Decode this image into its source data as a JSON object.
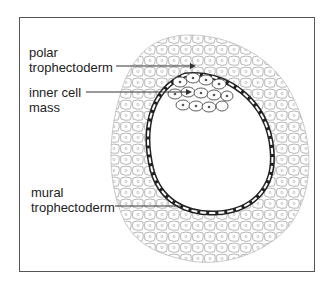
{
  "diagram": {
    "labels": {
      "polar_line1": "polar",
      "polar_line2": "trophectoderm",
      "icm_line1": "inner cell",
      "icm_line2": "mass",
      "mural_line1": "mural",
      "mural_line2": "trophectoderm"
    }
  }
}
